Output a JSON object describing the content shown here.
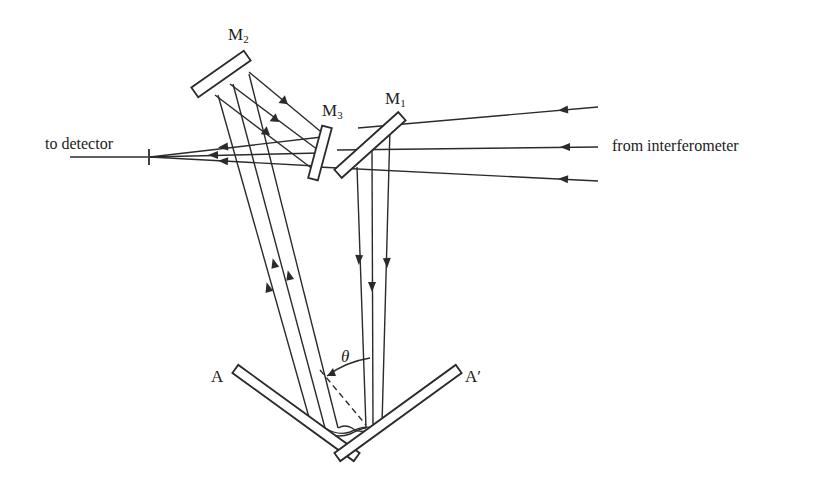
{
  "diagram": {
    "labels": {
      "m1": "M",
      "m1_sub": "1",
      "m2": "M",
      "m2_sub": "2",
      "m3": "M",
      "m3_sub": "3",
      "a": "A",
      "a_prime": "A′",
      "theta": "θ",
      "to_detector": "to detector",
      "from_interferometer": "from interferometer"
    },
    "colors": {
      "ink": "#2b2b2b",
      "background": "#ffffff"
    }
  }
}
